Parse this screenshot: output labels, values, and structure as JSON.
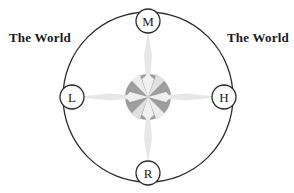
{
  "figure": {
    "title": "",
    "shape": "compass-rose-in-circle",
    "labels": {
      "left_text": "The World",
      "right_text": "The World"
    },
    "markers": [
      {
        "id": "M",
        "label": "M",
        "position": "top",
        "cx": 148,
        "cy": 21,
        "r": 12
      },
      {
        "id": "H",
        "label": "H",
        "position": "right",
        "cx": 224,
        "cy": 97,
        "r": 12
      },
      {
        "id": "R",
        "label": "R",
        "position": "bottom",
        "cx": 148,
        "cy": 173,
        "r": 12
      },
      {
        "id": "L",
        "label": "L",
        "position": "left",
        "cx": 72,
        "cy": 97,
        "r": 12
      }
    ],
    "outer_circle": {
      "cx": 148,
      "cy": 97,
      "r": 85
    },
    "center_disc": {
      "cx": 148,
      "cy": 97,
      "r": 23
    },
    "colors": {
      "stroke": "#2b2b2b",
      "text": "#1a1a1a",
      "disc_gray": "#9e9e9e",
      "rose_light": "#e8e8e8",
      "rose_mid": "#d2d2d2",
      "background": "#ffffff"
    }
  }
}
